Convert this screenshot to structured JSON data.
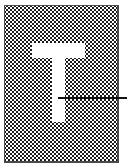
{
  "figure": {
    "kind": "letterform-specimen",
    "caption": "",
    "background_color": "#ffffff",
    "canvas": {
      "width": 127,
      "height": 168
    }
  },
  "plate": {
    "name": "halftone-plate",
    "label": "",
    "fill_style": "50% checkerboard dither",
    "dither_cell_px": 2,
    "ink_color": "#1b1b1b",
    "paper_color": "#ffffff",
    "border_color": "#4a4a4a",
    "bounds": {
      "x": 4,
      "y": 5,
      "width": 115,
      "height": 158
    }
  },
  "glyph": {
    "character": "T",
    "label": "",
    "style": "sans-serif capital, reversed out of plate",
    "fill_color": "#ffffff",
    "crossbar": {
      "x": 32,
      "y": 43,
      "width": 53,
      "height": 15
    },
    "stem": {
      "x": 52,
      "y": 56,
      "width": 13,
      "height": 66
    }
  },
  "callout": {
    "label": "",
    "line_color": "#111111",
    "thickness_px": 2,
    "from": {
      "x": 58,
      "y": 98
    },
    "to": {
      "x": 127,
      "y": 98
    }
  }
}
